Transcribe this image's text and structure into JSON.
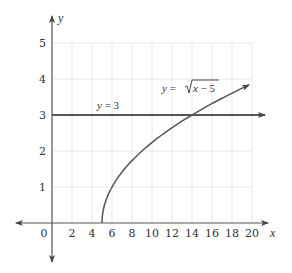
{
  "chart_data": {
    "type": "line",
    "title": "",
    "xlabel": "x",
    "ylabel": "y",
    "xlim": [
      0,
      20
    ],
    "ylim": [
      0,
      5
    ],
    "grid": true,
    "x_ticks": [
      "0",
      "2",
      "4",
      "6",
      "8",
      "10",
      "12",
      "14",
      "16",
      "18",
      "20"
    ],
    "y_ticks": [
      "1",
      "2",
      "3",
      "4",
      "5"
    ],
    "series": [
      {
        "name": "y = √(x − 5)",
        "label_prefix": "y = ",
        "label_radical": "x − 5",
        "x": [
          5,
          5.25,
          6,
          7,
          8,
          9,
          10,
          11,
          12,
          13,
          14,
          15,
          16,
          17,
          18,
          19,
          19.7
        ],
        "values": [
          0,
          0.5,
          1,
          1.41,
          1.73,
          2,
          2.24,
          2.45,
          2.65,
          2.83,
          3,
          3.16,
          3.32,
          3.46,
          3.61,
          3.74,
          3.83
        ],
        "arrow_end": true
      },
      {
        "name": "y = 3",
        "label": "y = 3",
        "x": [
          0,
          21.3
        ],
        "values": [
          3,
          3
        ],
        "arrow_end": true
      }
    ],
    "intersection": {
      "x": 14,
      "y": 3
    },
    "colors": {
      "curve": "#555555",
      "axis": "#555555",
      "grid": "#e8e8e8",
      "text": "#333333"
    }
  }
}
